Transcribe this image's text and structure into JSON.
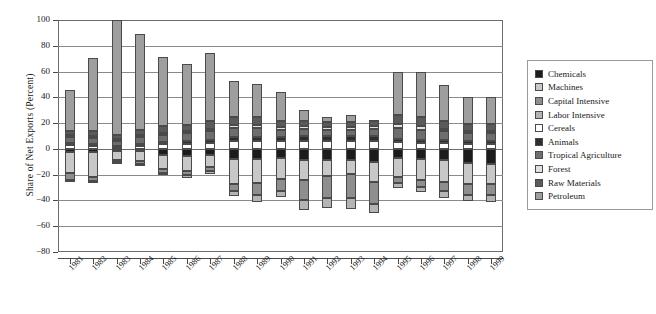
{
  "chart_data": {
    "type": "bar",
    "stacked": true,
    "title": "",
    "xlabel": "",
    "ylabel": "Share of Net Exports (Percent)",
    "ylim": [
      -80,
      100
    ],
    "yticks": [
      100,
      80,
      60,
      40,
      20,
      0,
      -20,
      -40,
      -60,
      -80
    ],
    "ytick_labels": [
      "100",
      "80",
      "60",
      "40",
      "20",
      "0",
      "−20",
      "−40",
      "−60",
      "−80"
    ],
    "grid": true,
    "legend_position": "right",
    "categories": [
      "1981",
      "1982",
      "1983",
      "1984",
      "1985",
      "1986",
      "1987",
      "1988",
      "1989",
      "1990",
      "1991",
      "1992",
      "1993",
      "1994",
      "1995",
      "1996",
      "1997",
      "1998",
      "1999"
    ],
    "series": [
      {
        "name": "Chemicals",
        "color": "#1c1c1c",
        "values": [
          -2.5,
          -2.5,
          -2.0,
          -2.0,
          -4.5,
          -5.5,
          -5.0,
          -8.0,
          -8.0,
          -7.0,
          -8.5,
          -9.0,
          -9.0,
          -10.0,
          -7.0,
          -7.5,
          -9.0,
          -11.0,
          -11.5
        ]
      },
      {
        "name": "Machines",
        "color": "#c8c8c8",
        "values": [
          -16.0,
          -19.0,
          -6.5,
          -7.5,
          -11.0,
          -11.5,
          -9.0,
          -19.0,
          -18.5,
          -16.0,
          -16.0,
          -12.0,
          -10.5,
          -16.0,
          -15.0,
          -16.5,
          -17.0,
          -16.5,
          -16.0
        ]
      },
      {
        "name": "Capital Intensive",
        "color": "#8e8e8e",
        "values": [
          -6.0,
          -3.5,
          -1.5,
          -2.5,
          -3.0,
          -3.5,
          -3.5,
          -6.0,
          -9.5,
          -9.5,
          -15.5,
          -17.0,
          -18.5,
          -16.5,
          -4.5,
          -5.5,
          -7.0,
          -8.0,
          -8.5
        ]
      },
      {
        "name": "Labor Intensive",
        "color": "#b4b4b4",
        "values": [
          -1.5,
          -1.5,
          -0.5,
          -1.0,
          -1.5,
          -2.0,
          -2.0,
          -3.5,
          -5.5,
          -5.0,
          -7.5,
          -8.0,
          -8.5,
          -7.5,
          -3.5,
          -4.0,
          -5.0,
          -5.0,
          -5.0
        ]
      },
      {
        "name": "Cereals",
        "color": "#ffffff",
        "values": [
          3.0,
          2.0,
          1.5,
          2.5,
          3.5,
          4.0,
          4.5,
          6.0,
          6.5,
          6.0,
          6.5,
          6.5,
          6.5,
          6.5,
          5.0,
          4.5,
          4.5,
          4.0,
          4.0
        ]
      },
      {
        "name": "Animals",
        "color": "#2e2e2e",
        "values": [
          1.5,
          1.5,
          1.0,
          1.5,
          2.0,
          2.5,
          2.5,
          3.0,
          3.0,
          3.0,
          3.5,
          3.5,
          3.5,
          3.5,
          3.0,
          2.5,
          2.5,
          2.5,
          2.5
        ]
      },
      {
        "name": "Tropical Agriculture",
        "color": "#6e6e6e",
        "values": [
          4.5,
          5.0,
          4.0,
          5.0,
          5.5,
          5.5,
          6.5,
          7.0,
          6.5,
          6.0,
          5.5,
          5.0,
          5.0,
          5.5,
          8.5,
          8.0,
          6.5,
          5.5,
          5.5
        ]
      },
      {
        "name": "Forest",
        "color": "#e0e0e0",
        "values": [
          1.5,
          1.5,
          1.0,
          1.5,
          1.5,
          1.5,
          2.0,
          2.5,
          2.5,
          2.0,
          2.0,
          2.0,
          2.0,
          2.0,
          2.5,
          2.5,
          2.0,
          2.0,
          2.0
        ]
      },
      {
        "name": "Raw Materials",
        "color": "#5a5a5a",
        "values": [
          3.0,
          4.0,
          3.0,
          4.0,
          5.0,
          5.0,
          6.0,
          6.5,
          6.0,
          5.0,
          4.5,
          4.0,
          4.0,
          4.5,
          7.0,
          7.0,
          6.0,
          5.5,
          5.0
        ]
      },
      {
        "name": "Petroleum",
        "color": "#9e9e9e",
        "values": [
          32.0,
          56.5,
          89.5,
          75.0,
          53.5,
          47.5,
          53.0,
          27.5,
          26.0,
          22.5,
          8.5,
          3.5,
          5.5,
          0.5,
          34.0,
          35.5,
          28.0,
          21.0,
          21.5
        ]
      }
    ]
  },
  "axis": {
    "y_label": "Share of Net Exports (Percent)"
  },
  "legend": {
    "items": [
      {
        "label": "Chemicals",
        "color": "#1c1c1c"
      },
      {
        "label": "Machines",
        "color": "#c8c8c8"
      },
      {
        "label": "Capital Intensive",
        "color": "#8e8e8e"
      },
      {
        "label": "Labor Intensive",
        "color": "#b4b4b4"
      },
      {
        "label": "Cereals",
        "color": "#ffffff"
      },
      {
        "label": "Animals",
        "color": "#2e2e2e"
      },
      {
        "label": "Tropical Agriculture",
        "color": "#6e6e6e"
      },
      {
        "label": "Forest",
        "color": "#e0e0e0"
      },
      {
        "label": "Raw Materials",
        "color": "#5a5a5a"
      },
      {
        "label": "Petroleum",
        "color": "#9e9e9e"
      }
    ]
  }
}
